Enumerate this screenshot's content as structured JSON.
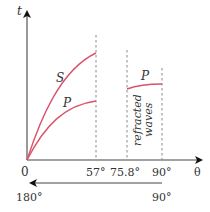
{
  "axes": {
    "y_label": "t",
    "x_label": "θ",
    "origin_label": "0"
  },
  "ticks": [
    {
      "label": "57°",
      "value": 57
    },
    {
      "label": "75.8°",
      "value": 75.8
    },
    {
      "label": "90°",
      "value": 90
    }
  ],
  "curves": [
    {
      "name": "S",
      "label": "S",
      "color": "#d9536b",
      "range": [
        0,
        57
      ]
    },
    {
      "name": "P",
      "label": "P",
      "color": "#d9536b",
      "range": [
        0,
        57
      ]
    },
    {
      "name": "P-refracted",
      "label": "P",
      "color": "#d9536b",
      "range": [
        75.8,
        90
      ]
    }
  ],
  "annotation": {
    "line1": "refracted",
    "line2": "waves"
  },
  "secondary_axis": {
    "start_label": "90°",
    "end_label": "180°",
    "direction": "leftward"
  },
  "colors": {
    "curve": "#d9536b",
    "axis": "#333333",
    "dashed": "#888888"
  }
}
